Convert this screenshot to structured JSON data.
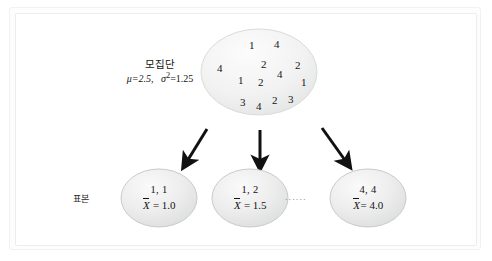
{
  "diagram": {
    "title_visible": false,
    "population": {
      "label_line1": "모집단",
      "label_mu": "μ=2.5,",
      "label_sigma": "σ",
      "label_sigma_exp": "2",
      "label_sigma_val": "=1.25",
      "values": [
        {
          "v": "1",
          "x": 249,
          "y": 39
        },
        {
          "v": "4",
          "x": 274,
          "y": 38
        },
        {
          "v": "4",
          "x": 217,
          "y": 62
        },
        {
          "v": "2",
          "x": 261,
          "y": 58
        },
        {
          "v": "4",
          "x": 277,
          "y": 68
        },
        {
          "v": "2",
          "x": 295,
          "y": 59
        },
        {
          "v": "1",
          "x": 238,
          "y": 74
        },
        {
          "v": "2",
          "x": 258,
          "y": 76
        },
        {
          "v": "1",
          "x": 301,
          "y": 76
        },
        {
          "v": "3",
          "x": 240,
          "y": 96
        },
        {
          "v": "4",
          "x": 256,
          "y": 100
        },
        {
          "v": "2",
          "x": 272,
          "y": 94
        },
        {
          "v": "3",
          "x": 288,
          "y": 93
        }
      ]
    },
    "sample_label": "표본",
    "ellipsis": "......",
    "samples": [
      {
        "pair": "1, 1",
        "mean_lhs": "X",
        "mean_rhs": " = 1.0"
      },
      {
        "pair": "1, 2",
        "mean_lhs": "X",
        "mean_rhs": " = 1.5"
      },
      {
        "pair": "4, 4",
        "mean_lhs": "X",
        "mean_rhs": "= 4.0"
      }
    ],
    "colors": {
      "ellipse_fill_light": "#f3f3f3",
      "ellipse_fill_dark": "#dcdddd",
      "ellipse_stroke": "#c9cacb",
      "arrow": "#111111",
      "text": "#1b1b1b",
      "frame": "#eceded"
    }
  }
}
